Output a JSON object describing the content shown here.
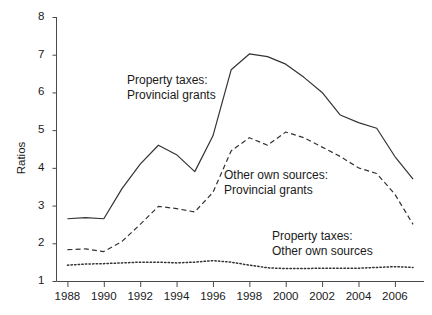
{
  "chart_data": {
    "type": "line",
    "title": "",
    "xlabel": "",
    "ylabel": "Ratios",
    "xlim": [
      1987.4,
      2007.6
    ],
    "ylim": [
      1,
      8
    ],
    "grid": false,
    "legend_position": "inline-annotations",
    "x": [
      1988,
      1989,
      1990,
      1991,
      1992,
      1993,
      1994,
      1995,
      1996,
      1997,
      1998,
      1999,
      2000,
      2001,
      2002,
      2003,
      2004,
      2005,
      2006,
      2007
    ],
    "y_ticks": [
      1,
      2,
      3,
      4,
      5,
      6,
      7,
      8
    ],
    "y_tick_labels": [
      "1",
      "2",
      "3",
      "4",
      "5",
      "6",
      "7",
      "8"
    ],
    "x_ticks": [
      1988,
      1990,
      1992,
      1994,
      1996,
      1998,
      2000,
      2002,
      2004,
      2006
    ],
    "x_tick_labels": [
      "1988",
      "1990",
      "1992",
      "1994",
      "1996",
      "1998",
      "2000",
      "2002",
      "2004",
      "2006"
    ],
    "series": [
      {
        "name": "Property taxes: Provincial grants",
        "style": "solid",
        "color": "#333333",
        "values": [
          2.65,
          2.68,
          2.65,
          3.45,
          4.1,
          4.6,
          4.35,
          3.9,
          4.85,
          6.6,
          7.02,
          6.95,
          6.75,
          6.4,
          6.0,
          5.4,
          5.2,
          5.05,
          4.3,
          3.7
        ]
      },
      {
        "name": "Other own sources: Provincial grants",
        "style": "dashed",
        "color": "#333333",
        "values": [
          1.83,
          1.85,
          1.78,
          2.05,
          2.5,
          2.98,
          2.92,
          2.83,
          3.35,
          4.45,
          4.8,
          4.6,
          4.95,
          4.8,
          4.55,
          4.3,
          4.0,
          3.85,
          3.3,
          2.5
        ]
      },
      {
        "name": "Property taxes: Other own sources",
        "style": "dotted",
        "color": "#333333",
        "values": [
          1.42,
          1.45,
          1.46,
          1.48,
          1.5,
          1.5,
          1.48,
          1.5,
          1.54,
          1.5,
          1.42,
          1.35,
          1.33,
          1.33,
          1.34,
          1.34,
          1.34,
          1.36,
          1.38,
          1.36
        ]
      }
    ],
    "annotations": [
      {
        "id": "ann-property-provincial",
        "lines": [
          "Property taxes:",
          "Provincial grants"
        ],
        "x_px": 127,
        "y_px": 73
      },
      {
        "id": "ann-other-provincial",
        "lines": [
          "Other own sources:",
          "Provincial grants"
        ],
        "x_px": 224,
        "y_px": 168
      },
      {
        "id": "ann-property-other",
        "lines": [
          "Property taxes:",
          "Other own sources"
        ],
        "x_px": 272,
        "y_px": 229
      }
    ]
  }
}
